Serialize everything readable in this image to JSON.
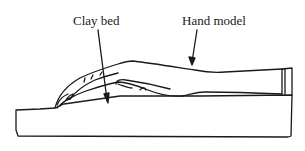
{
  "diagram": {
    "type": "line-illustration",
    "labels": [
      {
        "id": "clay_bed",
        "text": "Clay bed",
        "points_to": "clay bed block"
      },
      {
        "id": "hand_model",
        "text": "Hand model",
        "points_to": "hand model"
      }
    ],
    "colors": {
      "stroke": "#1a1a1a",
      "background": "#ffffff"
    }
  }
}
